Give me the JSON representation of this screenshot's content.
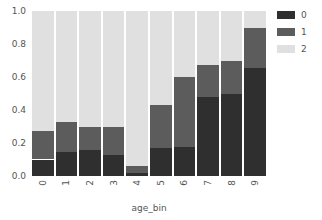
{
  "chart_data": {
    "type": "bar",
    "stacked": true,
    "normalized": true,
    "title": "",
    "xlabel": "age_bin",
    "ylabel": "",
    "categories": [
      "0",
      "1",
      "2",
      "3",
      "4",
      "5",
      "6",
      "7",
      "8",
      "9"
    ],
    "series": [
      {
        "name": "0",
        "color": "#2f2f2f",
        "values": [
          0.1,
          0.145,
          0.155,
          0.13,
          0.02,
          0.17,
          0.175,
          0.48,
          0.5,
          0.655
        ]
      },
      {
        "name": "1",
        "color": "#5c5c5c",
        "values": [
          0.17,
          0.185,
          0.145,
          0.17,
          0.04,
          0.26,
          0.425,
          0.19,
          0.2,
          0.245
        ]
      },
      {
        "name": "2",
        "color": "#e0e0e0",
        "values": [
          0.73,
          0.67,
          0.7,
          0.7,
          0.94,
          0.57,
          0.4,
          0.33,
          0.3,
          0.1
        ]
      }
    ],
    "cumulative_tops": {
      "series_0": [
        0.1,
        0.145,
        0.155,
        0.13,
        0.02,
        0.17,
        0.175,
        0.48,
        0.5,
        0.655
      ],
      "series_1": [
        0.27,
        0.33,
        0.3,
        0.3,
        0.06,
        0.43,
        0.6,
        0.67,
        0.7,
        0.9
      ],
      "series_2": [
        1.0,
        1.0,
        1.0,
        1.0,
        1.0,
        1.0,
        1.0,
        1.0,
        1.0,
        1.0
      ]
    },
    "ylim": [
      0.0,
      1.0
    ],
    "y_ticks": [
      "0.0",
      "0.2",
      "0.4",
      "0.6",
      "0.8",
      "1.0"
    ],
    "y_tick_values": [
      0.0,
      0.2,
      0.4,
      0.6,
      0.8,
      1.0
    ],
    "x_ticks": [
      "0",
      "1",
      "2",
      "3",
      "4",
      "5",
      "6",
      "7",
      "8",
      "9"
    ],
    "grid": false,
    "legend": {
      "position": "right",
      "title": "",
      "entries": [
        {
          "label": "0",
          "color": "#2f2f2f"
        },
        {
          "label": "1",
          "color": "#5c5c5c"
        },
        {
          "label": "2",
          "color": "#e0e0e0"
        }
      ]
    },
    "colors": {
      "series_0": "#2f2f2f",
      "series_1": "#5c5c5c",
      "series_2": "#e0e0e0",
      "background": "#ffffff",
      "text": "#555555"
    }
  }
}
